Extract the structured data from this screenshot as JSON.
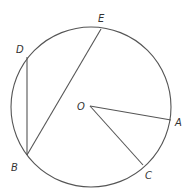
{
  "diagram": {
    "type": "circle-geometry",
    "circle": {
      "cx": 91,
      "cy": 107,
      "r": 80
    },
    "points": {
      "O": {
        "label": "O",
        "x": 90,
        "y": 106
      },
      "A": {
        "label": "A",
        "x": 171,
        "y": 120
      },
      "B": {
        "label": "B",
        "x": 27,
        "y": 155
      },
      "C": {
        "label": "C",
        "x": 143,
        "y": 165
      },
      "D": {
        "label": "D",
        "x": 27,
        "y": 57
      },
      "E": {
        "label": "E",
        "x": 101,
        "y": 29
      }
    },
    "segments": [
      {
        "from": "D",
        "to": "B",
        "name": "chord DB"
      },
      {
        "from": "B",
        "to": "E",
        "name": "chord BE"
      },
      {
        "from": "O",
        "to": "A",
        "name": "radius OA"
      },
      {
        "from": "O",
        "to": "C",
        "name": "radius OC"
      }
    ]
  }
}
